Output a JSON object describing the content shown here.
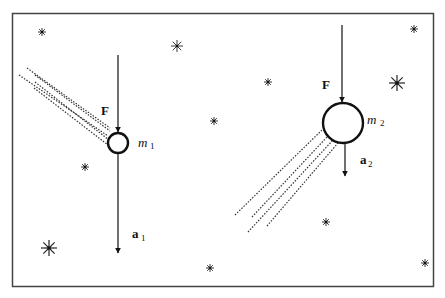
{
  "diagram": {
    "colors": {
      "ink": "#111111",
      "frame": "#444444",
      "background": "#ffffff"
    },
    "frame": {
      "x": 12,
      "y": 13,
      "width": 421,
      "height": 273
    },
    "bodies": [
      {
        "id": "m1",
        "mass_label": "m",
        "mass_sub": "1",
        "cx": 118,
        "cy": 143,
        "r": 10,
        "force_label": "F",
        "force_from_y": 55,
        "accel_label": "a",
        "accel_sub": "1",
        "accel_to_y": 253
      },
      {
        "id": "m2",
        "mass_label": "m",
        "mass_sub": "2",
        "cx": 343,
        "cy": 123,
        "r": 20,
        "force_label": "F",
        "force_from_y": 25,
        "accel_label": "a",
        "accel_sub": "2",
        "accel_to_y": 176
      }
    ],
    "stars": [
      {
        "x": 42,
        "y": 32,
        "size": "small"
      },
      {
        "x": 177,
        "y": 46,
        "size": "medium"
      },
      {
        "x": 414,
        "y": 29,
        "size": "small"
      },
      {
        "x": 268,
        "y": 82,
        "size": "small"
      },
      {
        "x": 397,
        "y": 83,
        "size": "large"
      },
      {
        "x": 214,
        "y": 121,
        "size": "small"
      },
      {
        "x": 85,
        "y": 167,
        "size": "small"
      },
      {
        "x": 49,
        "y": 248,
        "size": "large"
      },
      {
        "x": 210,
        "y": 268,
        "size": "small"
      },
      {
        "x": 326,
        "y": 222,
        "size": "small"
      },
      {
        "x": 425,
        "y": 263,
        "size": "small"
      }
    ]
  }
}
